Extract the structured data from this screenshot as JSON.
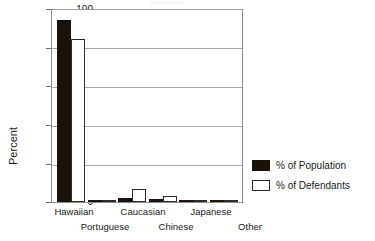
{
  "chart_data": {
    "type": "bar",
    "title": "",
    "xlabel": "",
    "ylabel": "Percent",
    "ylim": [
      0,
      100
    ],
    "yticks": [
      0,
      20,
      40,
      60,
      80,
      100
    ],
    "grid": true,
    "legend_position": "right",
    "categories": [
      "Hawaiian",
      "Portuguese",
      "Caucasian",
      "Chinese",
      "Japanese",
      "Other"
    ],
    "series": [
      {
        "name": "% of Population",
        "color": "#1a1208",
        "values": [
          95,
          0.5,
          2,
          1.5,
          1,
          1
        ]
      },
      {
        "name": "% of Defendants",
        "color": "#ffffff",
        "values": [
          85,
          1,
          7,
          3,
          1,
          1
        ]
      }
    ]
  },
  "axis": {
    "y_title": "Percent",
    "y_tick_labels": [
      "100",
      "80",
      "60",
      "40",
      "20",
      "0"
    ]
  },
  "legend": {
    "items": [
      {
        "label": "% of Population",
        "swatch": "filled-black-swatch"
      },
      {
        "label": "% of Defendants",
        "swatch": "outlined-white-swatch"
      }
    ]
  }
}
